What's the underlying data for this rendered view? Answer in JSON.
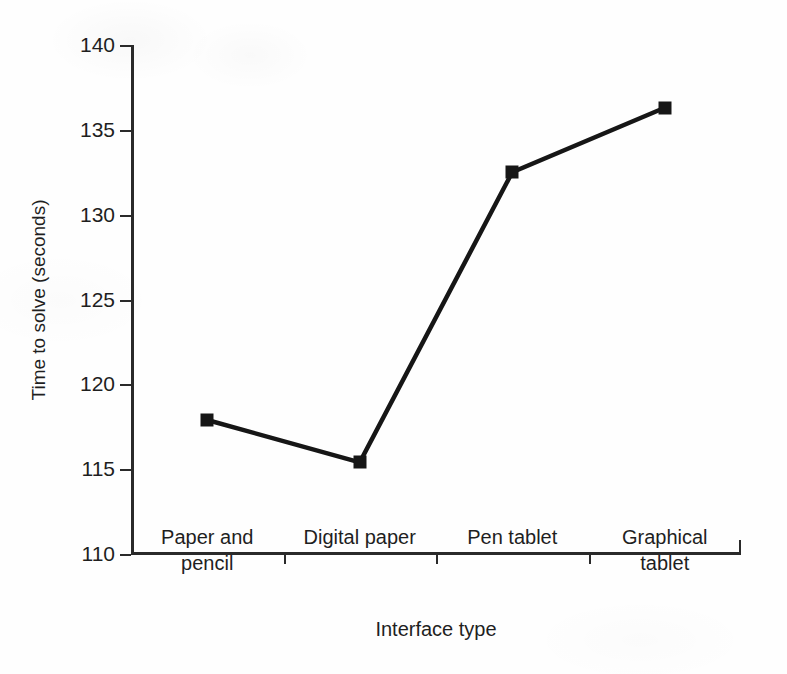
{
  "chart_data": {
    "type": "line",
    "title": "",
    "xlabel": "Interface type",
    "ylabel": "Time to solve (seconds)",
    "categories": [
      "Paper and pencil",
      "Digital paper",
      "Pen tablet",
      "Graphical tablet"
    ],
    "category_lines": [
      [
        "Paper and",
        "pencil"
      ],
      [
        "Digital paper"
      ],
      [
        "Pen tablet"
      ],
      [
        "Graphical",
        "tablet"
      ]
    ],
    "values": [
      117.9,
      115.4,
      132.5,
      136.3
    ],
    "series": [
      {
        "name": "Time to solve",
        "values": [
          117.9,
          115.4,
          132.5,
          136.3
        ]
      }
    ],
    "ylim": [
      110,
      140
    ],
    "ytick_labels": [
      "140",
      "135",
      "130",
      "125",
      "120",
      "115",
      "110"
    ],
    "yticks": [
      140,
      135,
      130,
      125,
      120,
      115,
      110
    ],
    "ystep": 5,
    "grid": false,
    "legend": false,
    "legend_position": "none",
    "marker": "square",
    "marker_color": "#161616",
    "line_color": "#161616",
    "line_width_px": 4,
    "background_color": "#ffffff"
  },
  "axes": {
    "y_title": "Time to solve (seconds)",
    "x_title": "Interface type"
  }
}
